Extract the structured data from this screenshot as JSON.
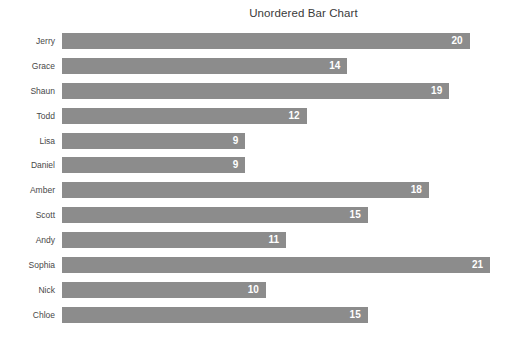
{
  "chart": {
    "title": "Unordered Bar Chart"
  },
  "colors": {
    "background": "#ffffff",
    "bar": "#8c8c8c",
    "title_text": "#3a3a3a",
    "category_label_text": "#484848",
    "value_label_text": "#ffffff"
  },
  "chart_data": {
    "type": "bar",
    "orientation": "horizontal",
    "title": "Unordered Bar Chart",
    "xlabel": "",
    "ylabel": "",
    "categories": [
      "Jerry",
      "Grace",
      "Shaun",
      "Todd",
      "Lisa",
      "Daniel",
      "Amber",
      "Scott",
      "Andy",
      "Sophia",
      "Nick",
      "Chloe"
    ],
    "values": [
      20,
      14,
      19,
      12,
      9,
      9,
      18,
      15,
      11,
      21,
      10,
      15
    ],
    "xlim": [
      0,
      21
    ],
    "grid": false,
    "legend": false,
    "axes_visible": false,
    "value_labels_position": "inside-end"
  }
}
